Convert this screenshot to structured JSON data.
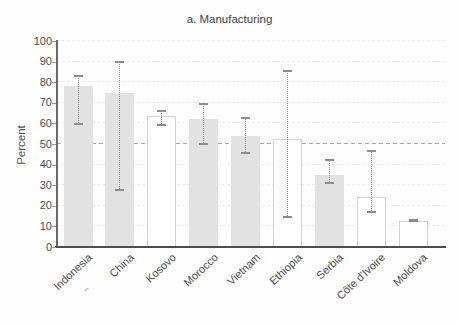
{
  "title": "a. Manufacturing",
  "chart_data": {
    "type": "bar",
    "title": "a. Manufacturing",
    "xlabel": "",
    "ylabel": "Percent",
    "ylim": [
      0,
      100
    ],
    "yticks": [
      0,
      10,
      20,
      30,
      40,
      50,
      60,
      70,
      80,
      90,
      100
    ],
    "reference_line_y": 50,
    "grid": "horizontal-dashed",
    "legend": "none",
    "categories": [
      "Indonesia",
      "China",
      "Kosovo",
      "Morocco",
      "Vietnam",
      "Ethiopia",
      "Serbia",
      "Côte d'Ivoire",
      "Moldova"
    ],
    "values": [
      78,
      75,
      63.5,
      62,
      54,
      52.5,
      35,
      24.5,
      12.5
    ],
    "ci_low": [
      59,
      27,
      58.5,
      49.5,
      45,
      14,
      30.5,
      16.5,
      12
    ],
    "ci_high": [
      83.5,
      90.5,
      66.5,
      70,
      63,
      86,
      42.5,
      47,
      13.5
    ],
    "bar_styles": [
      "filled",
      "filled",
      "outline",
      "filled",
      "filled",
      "outline",
      "filled",
      "outline",
      "outline"
    ],
    "colors": {
      "bar_fill": "#e2e2e2",
      "bar_outline": "#d2d2d2",
      "error_bar": "#8f8f8f",
      "reference_line": "#ababab",
      "gridline": "#ececec",
      "axis": "#5a5a5a",
      "text": "#4f4f4f"
    }
  }
}
